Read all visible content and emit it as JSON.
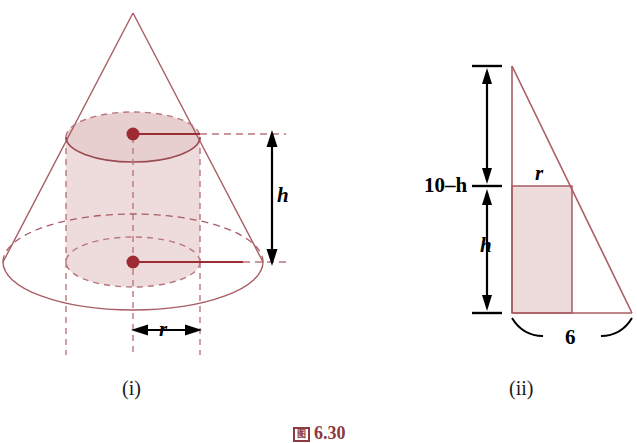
{
  "figure": {
    "caption_glyph": "图",
    "caption_number": "6.30",
    "panels": [
      {
        "id": "panel-i",
        "label": "(i)",
        "description": "cone-with-inscribed-cylinder",
        "labels": {
          "height": "h",
          "radius": "r"
        }
      },
      {
        "id": "panel-ii",
        "label": "(ii)",
        "description": "cross-section-triangle-with-inscribed-rectangle",
        "labels": {
          "upper_height": "10–h",
          "lower_height": "h",
          "radius": "r",
          "base": "6"
        }
      }
    ],
    "colors": {
      "outline": "#a85c63",
      "fill": "#eedcdc",
      "dot": "#9c2b33",
      "dash": "#b9767c",
      "arrow": "#000000",
      "caption": "#8c3b43"
    }
  }
}
